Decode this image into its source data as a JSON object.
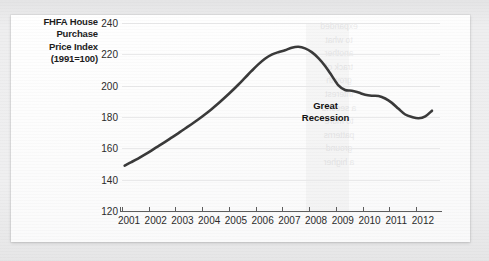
{
  "chart_data": {
    "type": "line",
    "title": "",
    "xlabel": "",
    "ylabel": "FHFA House Purchase Price Index (1991=100)",
    "ylabel_lines": [
      "FHFA House",
      "Purchase",
      "Price Index",
      "(1991=100)"
    ],
    "xlim": [
      2001,
      2012.9
    ],
    "ylim": [
      120,
      240
    ],
    "yticks": [
      240,
      220,
      200,
      180,
      160,
      140,
      120
    ],
    "xticks": [
      "2001",
      "2002",
      "2003",
      "2004",
      "2005",
      "2006",
      "2007",
      "2008",
      "2009",
      "2010",
      "2011",
      "2012"
    ],
    "grid": "horizontal",
    "legend": "none",
    "line_color": "#3a3a3a",
    "line_width": 2.6,
    "series": [
      {
        "name": "FHFA House Purchase Price Index",
        "x": [
          2001.1,
          2001.35,
          2001.6,
          2001.85,
          2002.1,
          2002.35,
          2002.6,
          2002.85,
          2003.1,
          2003.35,
          2003.6,
          2003.85,
          2004.1,
          2004.35,
          2004.6,
          2004.85,
          2005.1,
          2005.35,
          2005.6,
          2005.85,
          2006.1,
          2006.35,
          2006.6,
          2006.85,
          2007.1,
          2007.35,
          2007.6,
          2007.85,
          2008.1,
          2008.35,
          2008.6,
          2008.85,
          2009.1,
          2009.35,
          2009.6,
          2009.85,
          2010.1,
          2010.35,
          2010.6,
          2010.85,
          2011.1,
          2011.35,
          2011.6,
          2011.85,
          2012.1,
          2012.35,
          2012.6
        ],
        "y": [
          149.0,
          151.2,
          153.5,
          156.0,
          158.6,
          161.3,
          164.0,
          166.8,
          169.6,
          172.5,
          175.4,
          178.4,
          181.6,
          185.0,
          188.6,
          192.4,
          196.4,
          200.6,
          205.0,
          209.4,
          213.6,
          217.2,
          219.8,
          221.4,
          222.6,
          224.2,
          224.8,
          223.8,
          221.4,
          217.6,
          212.6,
          206.4,
          200.2,
          197.2,
          196.8,
          195.6,
          194.2,
          193.6,
          193.4,
          191.8,
          189.0,
          185.2,
          181.6,
          180.0,
          179.2,
          180.4,
          184.0
        ]
      }
    ],
    "annotations": [
      {
        "name": "great-recession",
        "lines": [
          "Great",
          "Recession"
        ],
        "x": 2008.62,
        "y": 183.0
      }
    ],
    "shaded_regions": [
      {
        "name": "recession-band",
        "x_start": 2007.88,
        "x_end": 2009.5,
        "color": "rgba(120,120,128,0.055)"
      }
    ]
  },
  "page": {
    "background_color": "#ececed",
    "card_color": "#fdfdfd",
    "bleed_through_lines": [
      "expanded",
      "to what",
      "another",
      "track of",
      "growth",
      "interest",
      "",
      "a second",
      "to more",
      "patterns",
      "ground",
      "a higher"
    ]
  }
}
